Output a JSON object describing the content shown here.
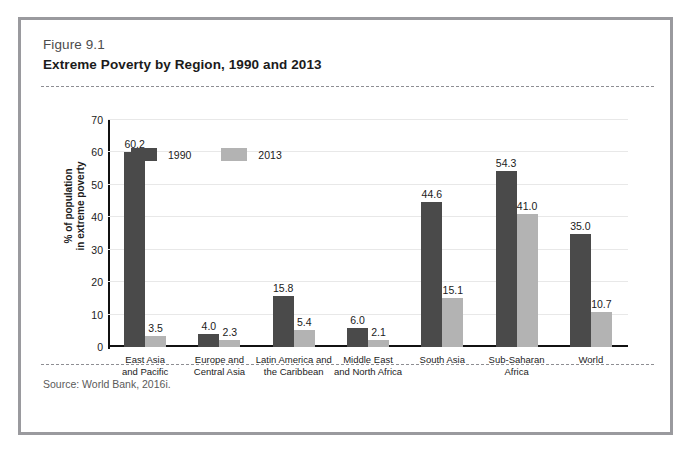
{
  "figure": {
    "number": "Figure 9.1",
    "title": "Extreme Poverty by Region, 1990 and 2013",
    "source": "Source:  World Bank, 2016i."
  },
  "colors": {
    "series_1990": "#4a4a4a",
    "series_2013": "#b3b3b3",
    "frame": "#9a9a9e",
    "gridline": "#e8e8e8",
    "axis": "#111111"
  },
  "chart_data": {
    "type": "bar",
    "title": "Extreme Poverty by Region, 1990 and 2013",
    "xlabel": "",
    "ylabel": "% of population\nin extreme poverty",
    "ylabel_line1": "% of population",
    "ylabel_line2": "in extreme poverty",
    "ylim": [
      0,
      70
    ],
    "yticks": [
      0,
      10,
      20,
      30,
      40,
      50,
      60,
      70
    ],
    "ytick_labels": [
      "0",
      "10",
      "20",
      "30",
      "40",
      "50",
      "60",
      "70"
    ],
    "grid": true,
    "legend_position": "top-center",
    "categories": [
      "East Asia\nand Pacific",
      "Europe and\nCentral Asia",
      "Latin America and\nthe Caribbean",
      "Middle East\nand North Africa",
      "South Asia",
      "Sub-Saharan\nAfrica",
      "World"
    ],
    "category_lines": [
      [
        "East Asia",
        "and Pacific"
      ],
      [
        "Europe and",
        "Central Asia"
      ],
      [
        "Latin America and",
        "the Caribbean"
      ],
      [
        "Middle East",
        "and North Africa"
      ],
      [
        "South Asia"
      ],
      [
        "Sub-Saharan",
        "Africa"
      ],
      [
        "World"
      ]
    ],
    "series": [
      {
        "name": "1990",
        "color": "#4a4a4a",
        "values": [
          60.2,
          4.0,
          15.8,
          6.0,
          44.6,
          54.3,
          35.0
        ],
        "labels": [
          "60.2",
          "4.0",
          "15.8",
          "6.0",
          "44.6",
          "54.3",
          "35.0"
        ]
      },
      {
        "name": "2013",
        "color": "#b3b3b3",
        "values": [
          3.5,
          2.3,
          5.4,
          2.1,
          15.1,
          41.0,
          10.7
        ],
        "labels": [
          "3.5",
          "2.3",
          "5.4",
          "2.1",
          "15.1",
          "41.0",
          "10.7"
        ]
      }
    ]
  }
}
